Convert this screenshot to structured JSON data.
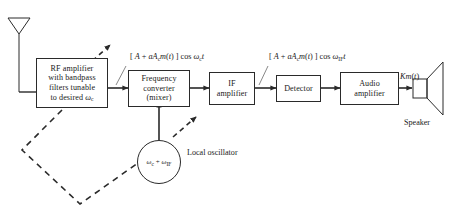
{
  "diagram": {
    "antenna": {
      "name": "antenna"
    },
    "blocks": [
      {
        "id": "rf-amplifier",
        "lines": [
          "RF amplifier",
          "with bandpass",
          "filters tunable",
          "to desired ω",
          "c"
        ]
      },
      {
        "id": "frequency-converter",
        "lines": [
          "Frequency",
          "converter",
          "(mixer)"
        ]
      },
      {
        "id": "if-amplifier",
        "lines": [
          "IF",
          "amplifier"
        ]
      },
      {
        "id": "detector",
        "lines": [
          "Detector"
        ]
      },
      {
        "id": "audio-amplifier",
        "lines": [
          "Audio",
          "amplifier"
        ]
      }
    ],
    "local_oscillator": {
      "circle_label": "ωc + ωIF",
      "label_line1": "Local",
      "label_line2": "oscillator"
    },
    "speaker": {
      "label": "Speaker"
    },
    "signals": {
      "rf_signal": "[ A + aAc m(t) ] cos ωc t",
      "if_signal": "[ A + aAc m(t) ] cos ωIF t",
      "audio_signal": "Km(t)"
    },
    "colors": {
      "line": "#2a2a2a",
      "background": "#ffffff",
      "text": "#1a1a1a"
    }
  }
}
